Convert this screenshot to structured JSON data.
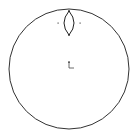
{
  "sketch": {
    "outer_circle": {
      "cx": 69,
      "cy": 69,
      "r": 60,
      "stroke": "#333333"
    },
    "lens": {
      "cx": 69,
      "top": 11,
      "bottom": 35,
      "half_width": 5,
      "stroke": "#222222"
    },
    "points": [
      {
        "x": 58,
        "y": 23
      },
      {
        "x": 80,
        "y": 23
      }
    ],
    "origin_axes": {
      "x": 69,
      "y": 68,
      "length": 7,
      "stroke": "#444444"
    },
    "colors": {
      "background": "#ffffff",
      "line": "#333333"
    }
  }
}
